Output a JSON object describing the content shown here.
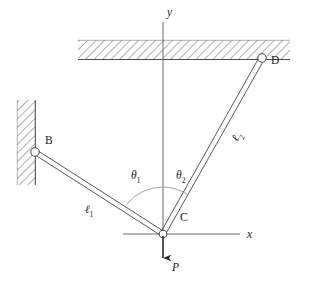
{
  "figure": {
    "type": "statics-free-body-diagram",
    "canvas": {
      "width": 309,
      "height": 291,
      "background": "#ffffff"
    },
    "stroke_color": "#4d4d4d",
    "text_color": "#1a1a1a",
    "arc_color": "#8c8c8c"
  },
  "axes": {
    "origin_label": "C",
    "x_axis": {
      "label": "x",
      "x_start": 123,
      "x_end": 240,
      "y": 234,
      "label_x": 248,
      "label_y": 235
    },
    "y_axis": {
      "label": "y",
      "x": 163,
      "y_start": 22,
      "y_end": 234,
      "label_x": 168,
      "label_y": 13
    }
  },
  "supports": [
    {
      "name": "ceiling-support",
      "orientation": "horizontal",
      "hatch": {
        "x": 78,
        "y": 40,
        "width": 212,
        "height": 19
      },
      "surface_line": {
        "x1": 78,
        "y1": 59,
        "x2": 290,
        "y2": 59
      }
    },
    {
      "name": "left-wall-support",
      "orientation": "vertical",
      "hatch": {
        "x": 17,
        "y": 100,
        "width": 18,
        "height": 85
      },
      "surface_line": {
        "x1": 35,
        "y1": 100,
        "x2": 35,
        "y2": 185
      }
    }
  ],
  "joints": [
    {
      "id": "B",
      "label": "B",
      "cx": 35,
      "cy": 152,
      "r": 4.2,
      "label_x": 45,
      "label_y": 142,
      "type": "pin-on-wall"
    },
    {
      "id": "D",
      "label": "D",
      "cx": 262,
      "cy": 58,
      "r": 4.2,
      "label_x": 272,
      "label_y": 62,
      "type": "pin-on-ceiling"
    },
    {
      "id": "C",
      "label": "C",
      "cx": 163,
      "cy": 234,
      "r": 3.8,
      "label_x": 181,
      "label_y": 219,
      "type": "pin-joint"
    }
  ],
  "members": [
    {
      "id": "BC",
      "label": "ℓ",
      "sub": "1",
      "from": "B",
      "to": "C",
      "x1": 35,
      "y1": 152,
      "x2": 163,
      "y2": 234,
      "label_x": 86,
      "label_y": 206
    },
    {
      "id": "CD",
      "label": "ℓ",
      "sub": "2",
      "from": "C",
      "to": "D",
      "x1": 163,
      "y1": 234,
      "x2": 262,
      "y2": 58,
      "label_x": 226,
      "label_y": 142
    }
  ],
  "angles": [
    {
      "id": "theta1",
      "label": "θ",
      "sub": "1",
      "between": [
        "member-BC",
        "y-axis"
      ],
      "vertex": "C",
      "radius": 47,
      "label_x": 133,
      "label_y": 172
    },
    {
      "id": "theta2",
      "label": "θ",
      "sub": "2",
      "between": [
        "y-axis",
        "member-CD"
      ],
      "vertex": "C",
      "radius": 47,
      "label_x": 177,
      "label_y": 172
    }
  ],
  "load": {
    "id": "P",
    "label": "P",
    "direction": "down",
    "applied_at": "C",
    "x": 163,
    "y_start": 236,
    "y_end": 266,
    "label_x": 174,
    "label_y": 269
  }
}
